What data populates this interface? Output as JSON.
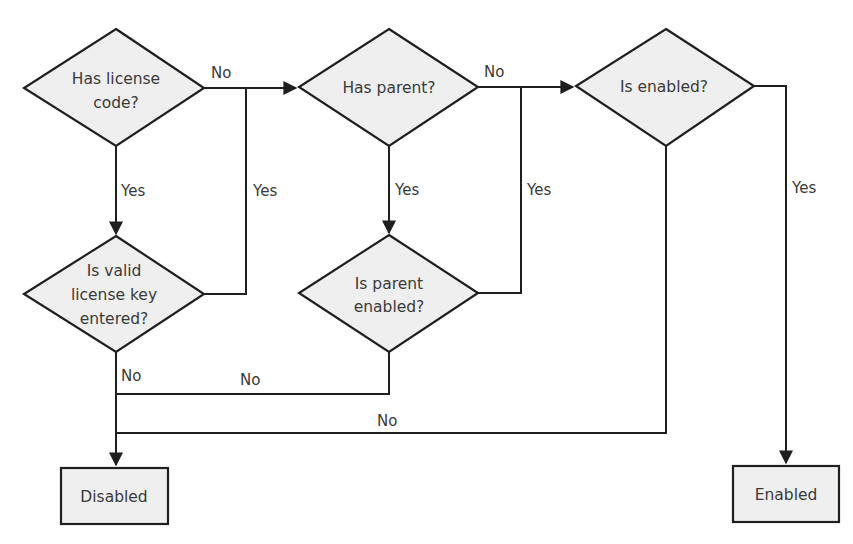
{
  "diagram": {
    "type": "flowchart",
    "nodes": [
      {
        "id": "has_license_code",
        "shape": "diamond",
        "lines": [
          "Has license",
          "code?"
        ]
      },
      {
        "id": "has_parent",
        "shape": "diamond",
        "lines": [
          "Has parent?"
        ]
      },
      {
        "id": "is_enabled",
        "shape": "diamond",
        "lines": [
          "Is enabled?"
        ]
      },
      {
        "id": "is_valid_license_key",
        "shape": "diamond",
        "lines": [
          "Is valid",
          "license key",
          "entered?"
        ]
      },
      {
        "id": "is_parent_enabled",
        "shape": "diamond",
        "lines": [
          "Is parent",
          "enabled?"
        ]
      },
      {
        "id": "disabled",
        "shape": "rectangle",
        "lines": [
          "Disabled"
        ]
      },
      {
        "id": "enabled",
        "shape": "rectangle",
        "lines": [
          "Enabled"
        ]
      }
    ],
    "edges": [
      {
        "from": "has_license_code",
        "to": "has_parent",
        "label": "No"
      },
      {
        "from": "has_license_code",
        "to": "is_valid_license_key",
        "label": "Yes"
      },
      {
        "from": "is_valid_license_key",
        "to": "has_parent",
        "label": "Yes"
      },
      {
        "from": "is_valid_license_key",
        "to": "disabled",
        "label": "No"
      },
      {
        "from": "has_parent",
        "to": "is_enabled",
        "label": "No"
      },
      {
        "from": "has_parent",
        "to": "is_parent_enabled",
        "label": "Yes"
      },
      {
        "from": "is_parent_enabled",
        "to": "is_enabled",
        "label": "Yes"
      },
      {
        "from": "is_parent_enabled",
        "to": "disabled",
        "label": "No"
      },
      {
        "from": "is_enabled",
        "to": "enabled",
        "label": "Yes"
      },
      {
        "from": "is_enabled",
        "to": "disabled",
        "label": "No"
      }
    ]
  },
  "labels": {
    "d1_line1": "Has license",
    "d1_line2": "code?",
    "d2_line1": "Has parent?",
    "d3_line1": "Is enabled?",
    "d4_line1": "Is valid",
    "d4_line2": "license key",
    "d4_line3": "entered?",
    "d5_line1": "Is parent",
    "d5_line2": "enabled?",
    "box_disabled": "Disabled",
    "box_enabled": "Enabled",
    "e_d1_no": "No",
    "e_d1_yes": "Yes",
    "e_d4_yes": "Yes",
    "e_d4_no": "No",
    "e_d2_no": "No",
    "e_d2_yes": "Yes",
    "e_d5_yes": "Yes",
    "e_d5_no": "No",
    "e_d3_yes": "Yes",
    "e_d3_no": "No"
  },
  "colors": {
    "shape_fill": "#efefef",
    "stroke": "#1f1f1f",
    "text": "#3a3a3a"
  }
}
